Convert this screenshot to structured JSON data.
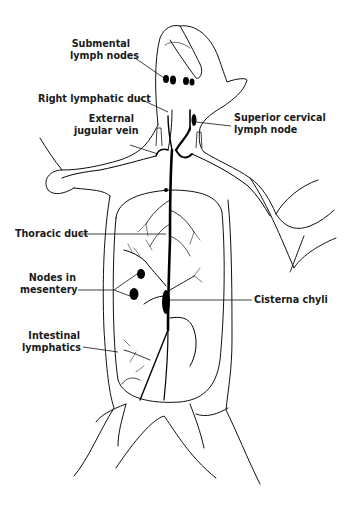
{
  "figure": {
    "colors": {
      "ink": "#111111",
      "background": "#ffffff"
    }
  },
  "labels": {
    "submental_line1": "Submental",
    "submental_line2": "lymph nodes",
    "right_lymphatic_duct": "Right lymphatic duct",
    "external_line1": "External",
    "external_line2": "jugular vein",
    "superior_line1": "Superior cervical",
    "superior_line2": "lymph node",
    "thoracic_duct": "Thoracic duct",
    "nodes_line1": "Nodes in",
    "nodes_line2": "mesentery",
    "cisterna_chyli": "Cisterna chyli",
    "intestinal_line1": "Intestinal",
    "intestinal_line2": "lymphatics"
  }
}
